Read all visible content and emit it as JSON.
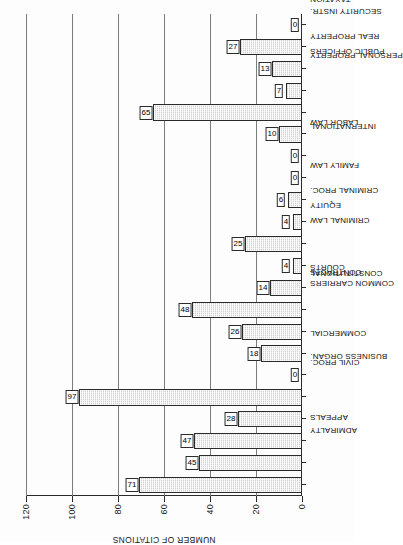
{
  "chart_data": {
    "type": "bar",
    "orientation": "vertical-printed-sideways",
    "title": "",
    "xlabel": "",
    "ylabel": "NUMBER OF CITATIONS",
    "ylim": [
      0,
      120
    ],
    "yticks": [
      0,
      20,
      40,
      60,
      80,
      100,
      120
    ],
    "grid": true,
    "legend": null,
    "categories": [
      "ADMIRALTY",
      "APPEALS",
      "BUSINESS ORGAN.",
      "CIVIL PROC.",
      "COMMERCIAL",
      "COMMON CARRIERS",
      "CONSTITUTIONAL",
      "CONTRACTS",
      "COURTS",
      "CRIMINAL LAW",
      "CRIMINAL PROC.",
      "EQUITY",
      "FAMILY LAW",
      "INTERNATIONAL",
      "LABOR LAW",
      "PERSONAL PROPERTY",
      "PUBLIC OFFICERS",
      "REAL PROPERTY",
      "SECURITY INSTR.",
      "STAT. OF PERSONS",
      "TAXATION",
      "TORTS"
    ],
    "values": [
      71,
      45,
      47,
      28,
      97,
      0,
      18,
      26,
      48,
      14,
      4,
      25,
      4,
      6,
      0,
      0,
      10,
      65,
      7,
      13,
      27,
      0
    ],
    "value_labels": [
      "71",
      "45",
      "47",
      "28",
      "97",
      "0",
      "18",
      "26",
      "48",
      "14",
      "4",
      "25",
      "4",
      "6",
      "0",
      "0",
      "10",
      "65",
      "7",
      "13",
      "27",
      "0"
    ],
    "colors": {
      "bar_fill": "#d2d2d2",
      "bar_edge": "#2b2b2b",
      "grid": "#7c7c7c",
      "axis": "#2b2b2b",
      "background": "#fdfdfd",
      "text": "#111111"
    }
  }
}
